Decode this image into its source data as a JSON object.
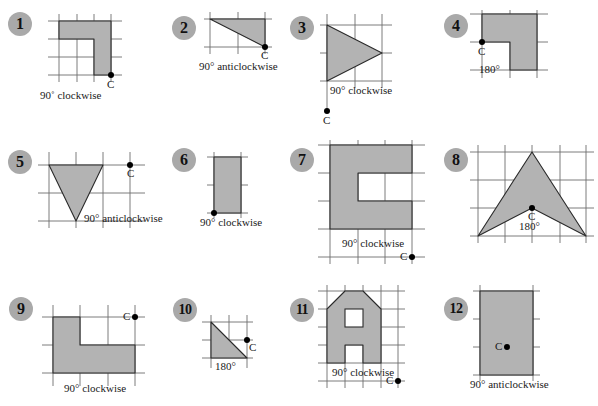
{
  "colors": {
    "shape_fill": "#b3b3b3",
    "badge_bg": "#a9a9a9",
    "grid": "#6e6e6e",
    "centre_point": "#000000"
  },
  "exercises": [
    {
      "number": "1",
      "rotation": "90˚ clockwise",
      "centre": "C",
      "shape": "L-shape"
    },
    {
      "number": "2",
      "rotation": "90° anticlockwise",
      "centre": "C",
      "shape": "right triangle"
    },
    {
      "number": "3",
      "rotation": "90° clockwise",
      "centre": "C",
      "shape": "triangle"
    },
    {
      "number": "4",
      "rotation": "180°",
      "centre": "C",
      "shape": "L-shape"
    },
    {
      "number": "5",
      "rotation": "90° anticlockwise",
      "centre": "C",
      "shape": "inverted triangle"
    },
    {
      "number": "6",
      "rotation": "90° clockwise",
      "centre": "",
      "shape": "rectangle"
    },
    {
      "number": "7",
      "rotation": "90° clockwise",
      "centre": "C",
      "shape": "C-shape"
    },
    {
      "number": "8",
      "rotation": "180°",
      "centre": "C",
      "shape": "arrowhead"
    },
    {
      "number": "9",
      "rotation": "90° clockwise",
      "centre": "C",
      "shape": "L-shape"
    },
    {
      "number": "10",
      "rotation": "180°",
      "centre": "C",
      "shape": "right triangle"
    },
    {
      "number": "11",
      "rotation": "90° clockwise",
      "centre": "C",
      "shape": "house shape with windows"
    },
    {
      "number": "12",
      "rotation": "90° anticlockwise",
      "centre": "C",
      "shape": "rectangle"
    }
  ]
}
